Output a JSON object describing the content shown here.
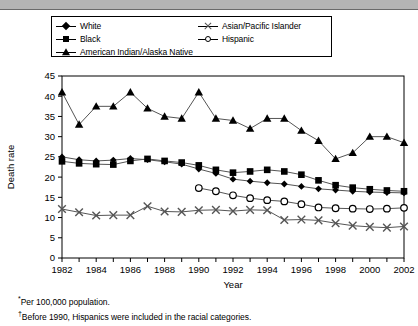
{
  "chart_data": {
    "type": "line",
    "title": "",
    "xlabel": "Year",
    "ylabel": "Death rate",
    "xlim": [
      1982,
      2002
    ],
    "ylim": [
      0,
      45
    ],
    "ytick_step": 5,
    "yticks": [
      0,
      5,
      10,
      15,
      20,
      25,
      30,
      35,
      40,
      45
    ],
    "xticks": [
      1982,
      1983,
      1984,
      1985,
      1986,
      1987,
      1988,
      1989,
      1990,
      1991,
      1992,
      1993,
      1994,
      1995,
      1996,
      1997,
      1998,
      1999,
      2000,
      2001,
      2002
    ],
    "xticklabels": [
      "1982",
      "",
      "1984",
      "",
      "1986",
      "",
      "1988",
      "",
      "1990",
      "",
      "1992",
      "",
      "1994",
      "",
      "1996",
      "",
      "1998",
      "",
      "2000",
      "",
      "2002"
    ],
    "grid": false,
    "legend_position": "above-plot",
    "x": [
      1982,
      1983,
      1984,
      1985,
      1986,
      1987,
      1988,
      1989,
      1990,
      1991,
      1992,
      1993,
      1994,
      1995,
      1996,
      1997,
      1998,
      1999,
      2000,
      2001,
      2002
    ],
    "series": [
      {
        "name": "White",
        "marker": "diamond",
        "values": [
          25.0,
          24.3,
          24.0,
          24.2,
          24.6,
          24.3,
          23.8,
          23.2,
          22.0,
          20.9,
          19.5,
          19.0,
          18.6,
          18.3,
          17.7,
          17.1,
          16.8,
          16.5,
          16.3,
          16.2,
          16.1
        ]
      },
      {
        "name": "Black",
        "marker": "square",
        "values": [
          23.9,
          23.4,
          23.2,
          23.1,
          24.0,
          24.5,
          24.0,
          23.6,
          22.9,
          21.8,
          21.1,
          21.4,
          21.8,
          21.4,
          20.6,
          19.2,
          18.0,
          17.4,
          17.0,
          16.7,
          16.5
        ]
      },
      {
        "name": "American Indian/Alaska Native",
        "marker": "triangle",
        "values": [
          41.0,
          33.0,
          37.5,
          37.5,
          41.0,
          37.0,
          35.0,
          34.5,
          41.0,
          34.5,
          34.0,
          32.0,
          34.5,
          34.5,
          31.5,
          29.0,
          24.5,
          26.0,
          30.0,
          30.0,
          28.5
        ]
      },
      {
        "name": "Asian/Pacific Islander",
        "marker": "x",
        "values": [
          12.1,
          11.3,
          10.5,
          10.6,
          10.6,
          12.8,
          11.5,
          11.4,
          11.8,
          11.9,
          11.6,
          11.9,
          11.8,
          9.4,
          9.5,
          9.3,
          8.6,
          8.0,
          7.7,
          7.5,
          7.8
        ]
      },
      {
        "name": "Hispanic",
        "marker": "circle",
        "values": [
          null,
          null,
          null,
          null,
          null,
          null,
          null,
          null,
          17.3,
          16.5,
          15.5,
          14.8,
          14.3,
          14.0,
          13.3,
          12.5,
          12.3,
          12.2,
          12.1,
          12.2,
          12.4
        ]
      }
    ]
  },
  "legend": {
    "items": [
      {
        "label": "White",
        "marker": "diamond"
      },
      {
        "label": "Black",
        "marker": "square"
      },
      {
        "label": "American Indian/Alaska Native",
        "marker": "triangle"
      },
      {
        "label": "Asian/Pacific Islander",
        "marker": "x"
      },
      {
        "label": "Hispanic",
        "marker": "circle"
      }
    ]
  },
  "footnotes": [
    {
      "mark": "*",
      "text": "Per 100,000 population."
    },
    {
      "mark": "†",
      "text": "Before 1990, Hispanics were included in the racial categories."
    }
  ],
  "colors": {
    "ink": "#000000",
    "line": "#555555",
    "topbar": "#b4b4b4",
    "background": "#ffffff"
  }
}
